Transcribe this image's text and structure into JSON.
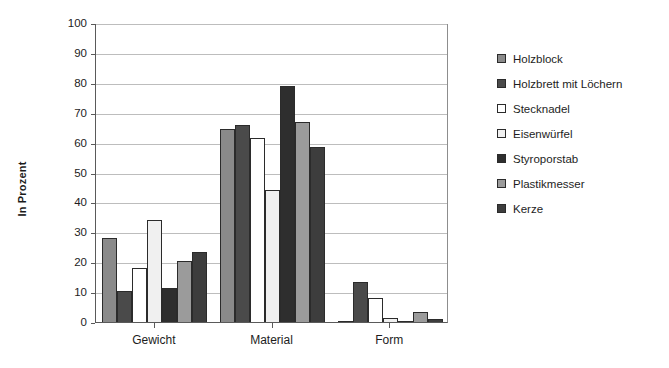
{
  "chart_data": {
    "type": "bar",
    "title": "",
    "xlabel": "",
    "ylabel": "In Prozent",
    "ylim": [
      0,
      100
    ],
    "ytick_step": 10,
    "yticks": [
      100,
      90,
      80,
      70,
      60,
      50,
      40,
      30,
      20,
      10,
      0
    ],
    "grid": true,
    "legend_position": "right",
    "categories": [
      "Gewicht",
      "Material",
      "Form"
    ],
    "series": [
      {
        "name": "Holzblock",
        "color": "#8a8a8a",
        "values": [
          28,
          64.5,
          0.5
        ]
      },
      {
        "name": "Holzbrett mit Löchern",
        "color": "#4a4a4a",
        "values": [
          10.5,
          66,
          13.5
        ]
      },
      {
        "name": "Stecknadel",
        "color": "#ffffff",
        "values": [
          18,
          61.5,
          8
        ]
      },
      {
        "name": "Eisenwürfel",
        "color": "#f0f0f0",
        "values": [
          34,
          44,
          1.5
        ]
      },
      {
        "name": "Styroporstab",
        "color": "#2e2e2e",
        "values": [
          11.5,
          79,
          0.5
        ]
      },
      {
        "name": "Plastikmesser",
        "color": "#9b9b9b",
        "values": [
          20.5,
          67,
          3.5
        ]
      },
      {
        "name": "Kerze",
        "color": "#3d3d3d",
        "values": [
          23.5,
          58.5,
          1
        ]
      }
    ]
  }
}
